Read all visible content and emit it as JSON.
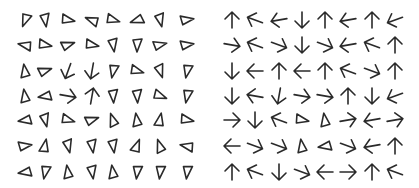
{
  "stimulus": {
    "background": "#ffffff",
    "stroke_color": "#2a2a2a",
    "rows_y": [
      20,
      45,
      71,
      96,
      120,
      146,
      172
    ],
    "left_panel": {
      "cols_x": [
        25,
        45,
        68,
        92,
        113,
        137,
        160,
        187
      ],
      "grid": [
        [
          [
            "tri",
            110
          ],
          [
            "tri",
            80
          ],
          [
            "tri",
            10
          ],
          [
            "tri",
            200
          ],
          [
            "tri",
            15
          ],
          [
            "tri",
            160
          ],
          [
            "tri",
            75
          ],
          [
            "tri",
            350
          ]
        ],
        [
          [
            "tri",
            190
          ],
          [
            "tri",
            10
          ],
          [
            "tri",
            340
          ],
          [
            "tri",
            10
          ],
          [
            "tri",
            80
          ],
          [
            "tri",
            90
          ],
          [
            "tri",
            345
          ],
          [
            "tri",
            350
          ]
        ],
        [
          [
            "tri",
            260
          ],
          [
            "tri",
            340
          ],
          [
            "arrow",
            110
          ],
          [
            "arrow",
            100
          ],
          [
            "tri",
            100
          ],
          [
            "tri",
            15
          ],
          [
            "tri",
            70
          ],
          [
            "tri",
            100
          ]
        ],
        [
          [
            "tri",
            260
          ],
          [
            "tri",
            170
          ],
          [
            "arrow",
            10
          ],
          [
            "arrow",
            280
          ],
          [
            "tri",
            85
          ],
          [
            "tri",
            85
          ],
          [
            "tri",
            20
          ],
          [
            "tri",
            100
          ]
        ],
        [
          [
            "tri",
            170
          ],
          [
            "tri",
            75
          ],
          [
            "tri",
            15
          ],
          [
            "tri",
            340
          ],
          [
            "tri",
            250
          ],
          [
            "tri",
            260
          ],
          [
            "tri",
            280
          ],
          [
            "tri",
            10
          ]
        ],
        [
          [
            "tri",
            350
          ],
          [
            "tri",
            280
          ],
          [
            "tri",
            75
          ],
          [
            "tri",
            80
          ],
          [
            "tri",
            80
          ],
          [
            "tri",
            290
          ],
          [
            "tri",
            250
          ],
          [
            "tri",
            190
          ]
        ],
        [
          [
            "tri",
            170
          ],
          [
            "tri",
            100
          ],
          [
            "tri",
            260
          ],
          [
            "tri",
            80
          ],
          [
            "tri",
            260
          ],
          [
            "tri",
            95
          ],
          [
            "tri",
            95
          ],
          [
            "tri",
            95
          ]
        ]
      ]
    },
    "right_panel": {
      "cols_x": [
        232,
        255,
        279,
        302,
        325,
        348,
        372,
        395
      ],
      "grid": [
        [
          [
            "arrow",
            270
          ],
          [
            "arrow",
            200
          ],
          [
            "arrow",
            170
          ],
          [
            "arrow",
            90
          ],
          [
            "arrow",
            270
          ],
          [
            "arrow",
            170
          ],
          [
            "arrow",
            270
          ],
          [
            "arrow",
            160
          ]
        ],
        [
          [
            "arrow",
            10
          ],
          [
            "arrow",
            200
          ],
          [
            "arrow",
            20
          ],
          [
            "arrow",
            90
          ],
          [
            "arrow",
            20
          ],
          [
            "arrow",
            170
          ],
          [
            "arrow",
            200
          ],
          [
            "arrow",
            270
          ]
        ],
        [
          [
            "arrow",
            90
          ],
          [
            "arrow",
            180
          ],
          [
            "arrow",
            270
          ],
          [
            "arrow",
            180
          ],
          [
            "arrow",
            270
          ],
          [
            "arrow",
            200
          ],
          [
            "arrow",
            20
          ],
          [
            "arrow",
            270
          ]
        ],
        [
          [
            "arrow",
            90
          ],
          [
            "arrow",
            190
          ],
          [
            "arrow",
            100
          ],
          [
            "arrow",
            10
          ],
          [
            "arrow",
            10
          ],
          [
            "arrow",
            270
          ],
          [
            "arrow",
            90
          ],
          [
            "arrow",
            160
          ]
        ],
        [
          [
            "arrow",
            0
          ],
          [
            "arrow",
            90
          ],
          [
            "arrow",
            200
          ],
          [
            "tri",
            10
          ],
          [
            "tri",
            260
          ],
          [
            "arrow",
            350
          ],
          [
            "arrow",
            170
          ],
          [
            "arrow",
            350
          ]
        ],
        [
          [
            "arrow",
            180
          ],
          [
            "arrow",
            20
          ],
          [
            "arrow",
            20
          ],
          [
            "tri",
            260
          ],
          [
            "tri",
            170
          ],
          [
            "arrow",
            20
          ],
          [
            "arrow",
            170
          ],
          [
            "arrow",
            270
          ]
        ],
        [
          [
            "arrow",
            270
          ],
          [
            "arrow",
            200
          ],
          [
            "arrow",
            90
          ],
          [
            "arrow",
            20
          ],
          [
            "arrow",
            180
          ],
          [
            "arrow",
            0
          ],
          [
            "arrow",
            270
          ],
          [
            "arrow",
            200
          ]
        ]
      ]
    }
  }
}
